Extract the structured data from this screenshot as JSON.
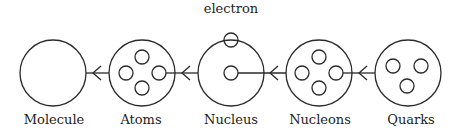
{
  "diagram": {
    "type": "composition-chain",
    "direction": "right-to-left",
    "stages": [
      {
        "id": "molecule",
        "label": "Molecule",
        "inner_circles": 0
      },
      {
        "id": "atoms",
        "label": "Atoms",
        "inner_circles": 4
      },
      {
        "id": "nucleus",
        "label": "Nucleus",
        "inner_circles": 1,
        "annotation": "electron"
      },
      {
        "id": "nucleons",
        "label": "Nucleons",
        "inner_circles": 4
      },
      {
        "id": "quarks",
        "label": "Quarks",
        "inner_circles": 3
      }
    ],
    "electron_label": "electron",
    "arrows": [
      {
        "from": "atoms",
        "to": "molecule"
      },
      {
        "from": "nucleus",
        "to": "atoms"
      },
      {
        "from": "nucleons",
        "to": "nucleus"
      },
      {
        "from": "quarks",
        "to": "nucleons"
      }
    ]
  }
}
